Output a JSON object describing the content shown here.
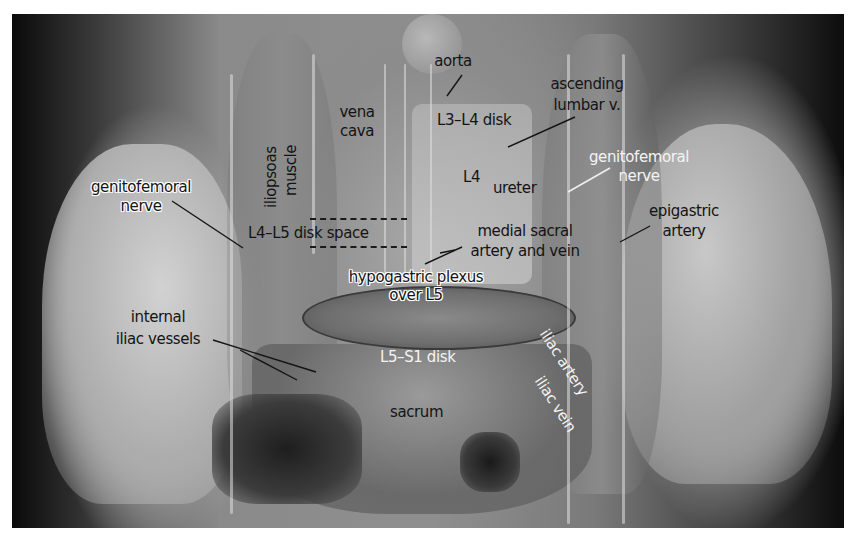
{
  "figure": {
    "labels": {
      "aorta": "aorta",
      "vena_cava_1": "vena",
      "vena_cava_2": "cava",
      "iliopsoas_1": "iliopsoas",
      "iliopsoas_2": "muscle",
      "l3_l4": "L3–L4 disk",
      "ascending_lumbar_1": "ascending",
      "ascending_lumbar_2": "lumbar v.",
      "l4": "L4",
      "ureter": "ureter",
      "genitofemoral_right_1": "genitofemoral",
      "genitofemoral_right_2": "nerve",
      "genitofemoral_left_1": "genitofemoral",
      "genitofemoral_left_2": "nerve",
      "epigastric_1": "epigastric",
      "epigastric_2": "artery",
      "l4_l5": "L4–L5 disk space",
      "medial_sacral_1": "medial sacral",
      "medial_sacral_2": "artery and vein",
      "hypogastric_1": "hypogastric plexus",
      "hypogastric_2": "over L5",
      "internal_iliac_1": "internal",
      "internal_iliac_2": "iliac vessels",
      "l5_s1": "L5–S1 disk",
      "sacrum": "sacrum",
      "iliac_artery": "iliac artery",
      "iliac_vein": "iliac vein"
    }
  }
}
